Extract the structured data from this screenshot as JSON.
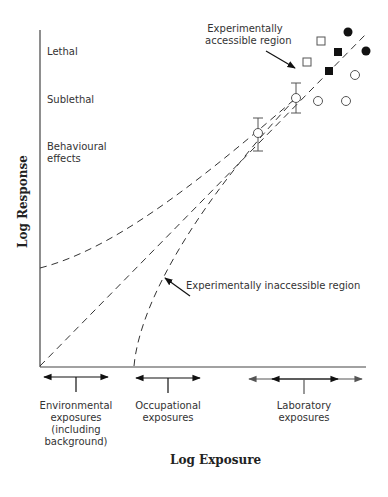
{
  "diagram": {
    "axes": {
      "x_title": "Log Exposure",
      "y_title": "Log Response"
    },
    "y_levels": [
      {
        "label": "Lethal"
      },
      {
        "label": "Sublethal"
      },
      {
        "label": "Behavioural effects",
        "line1": "Behavioural",
        "line2": "effects"
      }
    ],
    "annotations": {
      "accessible": {
        "line1": "Experimentally",
        "line2": "accessible region"
      },
      "inaccessible": "Experimentally inaccessible region"
    },
    "exposure_ranges": [
      {
        "lines": [
          "Environmental",
          "exposures",
          "(including",
          "background)"
        ]
      },
      {
        "lines": [
          "Occupational",
          "exposures"
        ]
      },
      {
        "lines": [
          "Laboratory",
          "exposures"
        ]
      }
    ],
    "curves": [
      {
        "name": "linear",
        "style": "dashed"
      },
      {
        "name": "supralinear-threshold-above-zero",
        "style": "dashed"
      },
      {
        "name": "threshold",
        "style": "dashed"
      }
    ],
    "data_points": {
      "filled_circles": 2,
      "filled_squares": 2,
      "open_squares": 2,
      "open_circles": 3,
      "open_circles_with_error_bars": 2
    },
    "colors": {
      "ink": "#222222",
      "text": "#333333",
      "grey_arrow": "#555555"
    }
  }
}
